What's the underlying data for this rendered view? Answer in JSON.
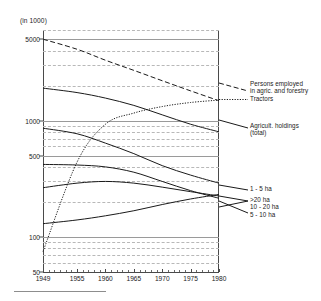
{
  "figure": {
    "unit_label": "(in 1000)",
    "y_axis": {
      "scale": "log",
      "ticks": [
        "5000",
        "1000",
        "500",
        "100",
        "50"
      ],
      "range": [
        50,
        6000
      ]
    },
    "x_axis": {
      "ticks": [
        "1949",
        "1955",
        "1960",
        "1965",
        "1970",
        "1975",
        "1980"
      ],
      "range": [
        1949,
        1980
      ]
    },
    "legend": {
      "persons": "Persons employed\nin agric. and forestry",
      "tractors": "Tractors",
      "holdings": "Agricult. holdings\n(total)",
      "ha_1_5": "1 - 5 ha",
      "ha_over20": ">20 ha",
      "ha_10_20": "10 - 20 ha",
      "ha_5_10": "5 - 10 ha"
    }
  },
  "chart_data": {
    "type": "line",
    "title": "",
    "xlabel": "",
    "ylabel": "(in 1000)",
    "yscale": "log",
    "ylim": [
      50,
      6000
    ],
    "xlim": [
      1949,
      1980
    ],
    "grid": true,
    "legend_position": "right",
    "x": [
      1949,
      1955,
      1960,
      1965,
      1970,
      1975,
      1980
    ],
    "series": [
      {
        "name": "Persons employed in agric. and forestry",
        "style": "dashed",
        "values": [
          5000,
          4100,
          3300,
          2700,
          2200,
          1800,
          1480
        ]
      },
      {
        "name": "Tractors",
        "style": "dotted",
        "values": [
          75,
          440,
          930,
          1160,
          1320,
          1430,
          1500
        ]
      },
      {
        "name": "Agricult. holdings (total)",
        "style": "solid",
        "values": [
          1900,
          1740,
          1560,
          1350,
          1120,
          930,
          800
        ]
      },
      {
        "name": "1 - 5 ha",
        "style": "solid",
        "values": [
          860,
          770,
          640,
          520,
          410,
          340,
          290
        ]
      },
      {
        "name": ">20 ha",
        "style": "solid",
        "values": [
          130,
          140,
          152,
          168,
          190,
          212,
          232
        ]
      },
      {
        "name": "10 - 20 ha",
        "style": "solid",
        "values": [
          265,
          290,
          300,
          290,
          268,
          245,
          225
        ]
      },
      {
        "name": "5 - 10 ha",
        "style": "solid",
        "values": [
          420,
          415,
          400,
          360,
          300,
          250,
          215
        ]
      }
    ]
  }
}
